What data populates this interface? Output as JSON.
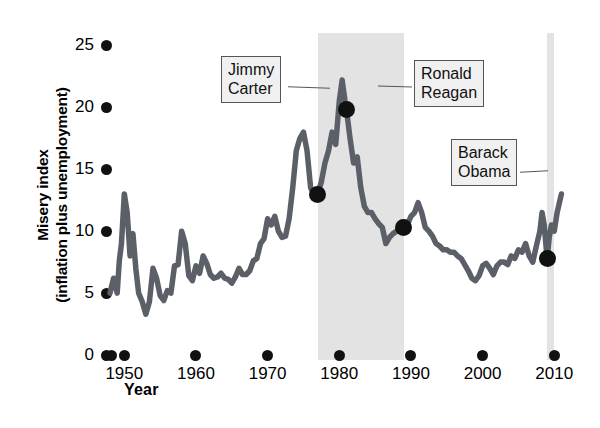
{
  "axes": {
    "ylabel_line1": "Misery index",
    "ylabel_line2": "(inflation plus unemployment)",
    "xlabel": "Year",
    "ytick_labels": [
      "0",
      "5",
      "10",
      "15",
      "20",
      "25"
    ],
    "xtick_labels": [
      "1950",
      "1960",
      "1970",
      "1980",
      "1990",
      "2000",
      "2010"
    ]
  },
  "annotations": {
    "carter_line1": "Jimmy",
    "carter_line2": "Carter",
    "reagan_line1": "Ronald",
    "reagan_line2": "Reagan",
    "obama_line1": "Barack",
    "obama_line2": "Obama"
  },
  "colors": {
    "series": "#5a5f68",
    "band": "#e3e3e3",
    "marker": "#111111",
    "callout_fill": "#f0f0f0",
    "callout_border": "#555555"
  },
  "chart_data": {
    "type": "line",
    "title": "",
    "xlabel": "Year",
    "ylabel": "Misery index (inflation plus unemployment)",
    "xlim": [
      1948,
      2011.5
    ],
    "ylim": [
      0,
      26
    ],
    "xticks": [
      1950,
      1960,
      1970,
      1980,
      1990,
      2000,
      2010
    ],
    "yticks": [
      0,
      5,
      10,
      15,
      20,
      25
    ],
    "grid": false,
    "legend": "none",
    "shaded_bands": [
      {
        "label": "Carter-Reagan era",
        "x_start": 1977.0,
        "x_end": 1989.0,
        "color": "#e3e3e3"
      },
      {
        "label": "Obama",
        "x_start": 2009.0,
        "x_end": 2010.0,
        "color": "#e3e3e3"
      }
    ],
    "markers": [
      {
        "label": "Jimmy Carter",
        "x": 1977.0,
        "y": 13.0
      },
      {
        "label": "Ronald Reagan",
        "x": 1981.0,
        "y": 19.8
      },
      {
        "label": "George H. W. Bush",
        "x": 1989.0,
        "y": 10.3
      },
      {
        "label": "Barack Obama",
        "x": 2009.0,
        "y": 7.8
      }
    ],
    "series": [
      {
        "name": "Misery index",
        "x": [
          1948.0,
          1948.5,
          1949.0,
          1949.3,
          1949.6,
          1950.0,
          1950.4,
          1950.8,
          1951.2,
          1951.6,
          1952.0,
          1952.5,
          1953.0,
          1953.5,
          1954.0,
          1954.5,
          1955.0,
          1955.5,
          1956.0,
          1956.5,
          1957.0,
          1957.5,
          1958.0,
          1958.5,
          1959.0,
          1959.5,
          1960.0,
          1960.5,
          1961.0,
          1961.5,
          1962.0,
          1962.5,
          1963.0,
          1963.5,
          1964.0,
          1964.5,
          1965.0,
          1965.5,
          1966.0,
          1966.5,
          1967.0,
          1967.5,
          1968.0,
          1968.5,
          1969.0,
          1969.5,
          1970.0,
          1970.5,
          1971.0,
          1971.5,
          1972.0,
          1972.5,
          1973.0,
          1973.5,
          1974.0,
          1974.5,
          1975.0,
          1975.5,
          1976.0,
          1976.5,
          1977.0,
          1977.5,
          1978.0,
          1978.5,
          1979.0,
          1979.5,
          1980.0,
          1980.4,
          1980.8,
          1981.0,
          1981.5,
          1982.0,
          1982.5,
          1983.0,
          1983.5,
          1984.0,
          1984.5,
          1985.0,
          1985.5,
          1986.0,
          1986.5,
          1987.0,
          1987.5,
          1988.0,
          1988.5,
          1989.0,
          1989.5,
          1990.0,
          1990.5,
          1991.0,
          1991.5,
          1992.0,
          1992.5,
          1993.0,
          1993.5,
          1994.0,
          1994.5,
          1995.0,
          1995.5,
          1996.0,
          1996.5,
          1997.0,
          1997.5,
          1998.0,
          1998.5,
          1999.0,
          1999.5,
          2000.0,
          2000.5,
          2001.0,
          2001.5,
          2002.0,
          2002.5,
          2003.0,
          2003.5,
          2004.0,
          2004.5,
          2005.0,
          2005.5,
          2006.0,
          2006.5,
          2007.0,
          2007.5,
          2008.0,
          2008.3,
          2008.6,
          2009.0,
          2009.3,
          2009.6,
          2010.0,
          2010.4,
          2010.8,
          2011.0
        ],
        "y": [
          5.0,
          6.2,
          5.0,
          7.6,
          9.0,
          13.0,
          11.5,
          8.0,
          9.8,
          7.0,
          5.0,
          4.3,
          3.3,
          4.3,
          7.0,
          6.2,
          4.8,
          4.4,
          5.2,
          5.0,
          7.2,
          7.3,
          10.0,
          9.0,
          6.4,
          6.0,
          7.2,
          6.6,
          8.0,
          7.4,
          6.5,
          6.2,
          6.3,
          6.6,
          6.2,
          6.1,
          5.8,
          6.3,
          7.0,
          6.5,
          6.5,
          6.8,
          7.6,
          7.8,
          9.0,
          9.4,
          11.0,
          10.5,
          11.2,
          10.0,
          9.5,
          9.6,
          11.0,
          13.5,
          16.5,
          17.5,
          18.0,
          16.5,
          13.5,
          13.0,
          13.0,
          14.0,
          15.5,
          16.5,
          18.0,
          17.0,
          20.5,
          22.2,
          20.5,
          19.8,
          17.5,
          15.5,
          16.0,
          13.5,
          12.0,
          11.5,
          11.5,
          11.0,
          10.6,
          10.3,
          9.0,
          9.5,
          9.8,
          10.0,
          10.0,
          10.3,
          10.5,
          11.2,
          11.5,
          12.3,
          11.5,
          10.3,
          10.0,
          9.6,
          9.0,
          8.8,
          8.5,
          8.5,
          8.3,
          8.3,
          8.0,
          7.8,
          7.3,
          6.8,
          6.2,
          6.0,
          6.4,
          7.2,
          7.4,
          7.0,
          6.5,
          7.2,
          7.5,
          7.5,
          7.3,
          8.0,
          7.8,
          8.5,
          8.3,
          9.0,
          8.0,
          7.5,
          8.8,
          10.0,
          11.5,
          10.5,
          7.8,
          9.5,
          10.5,
          10.0,
          11.5,
          12.5,
          13.0
        ]
      }
    ]
  }
}
